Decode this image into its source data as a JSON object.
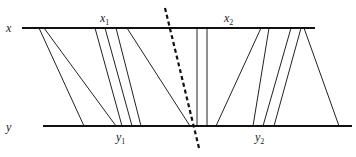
{
  "labels": {
    "x": "x",
    "y": "y",
    "x1": "x",
    "x1_sub": "1",
    "x2": "x",
    "x2_sub": "2",
    "y1": "y",
    "y1_sub": "1",
    "y2": "y",
    "y2_sub": "2"
  },
  "lines": {
    "top": {
      "x1": 22,
      "x2": 315,
      "y": 28
    },
    "bottom": {
      "x1": 43,
      "x2": 352,
      "y": 126
    }
  },
  "connections": [
    {
      "top": 39,
      "bottom": 84
    },
    {
      "top": 44,
      "bottom": 116
    },
    {
      "top": 95,
      "bottom": 122
    },
    {
      "top": 105,
      "bottom": 132
    },
    {
      "top": 116,
      "bottom": 141
    },
    {
      "top": 127,
      "bottom": 190
    },
    {
      "top": 197,
      "bottom": 197
    },
    {
      "top": 207,
      "bottom": 207
    },
    {
      "top": 261,
      "bottom": 216
    },
    {
      "top": 269,
      "bottom": 253
    },
    {
      "top": 291,
      "bottom": 263
    },
    {
      "top": 301,
      "bottom": 274
    },
    {
      "top": 304,
      "bottom": 339
    }
  ],
  "divider": {
    "x1": 165,
    "y1": 8,
    "x2": 199,
    "y2": 148,
    "style": "dashed"
  },
  "colors": {
    "stroke": "#222222",
    "background": "#ffffff"
  }
}
